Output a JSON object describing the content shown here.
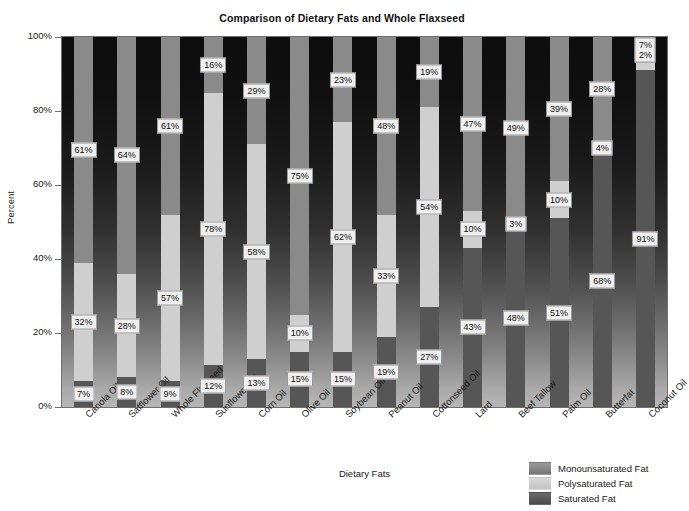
{
  "chart_data": {
    "type": "bar",
    "subtype": "stacked-column-100",
    "title": "Comparison of Dietary Fats and Whole Flaxseed",
    "xlabel": "Dietary Fats",
    "ylabel": "Percent",
    "ylim": [
      0,
      100
    ],
    "yticks": [
      "0%",
      "20%",
      "40%",
      "60%",
      "80%",
      "100%"
    ],
    "ytick_values": [
      0,
      20,
      40,
      60,
      80,
      100
    ],
    "grid": false,
    "legend_position": "bottom-right",
    "value_suffix": "%",
    "categories": [
      "Canola Oil",
      "Safflower Oil",
      "Whole Flaxseed",
      "Sunflower Oil",
      "Corn Oil",
      "Olive Oil",
      "Soybean Oil",
      "Peanut Oil",
      "Cottonseed Oil",
      "Lard",
      "Beef Tallow",
      "Palm Oil",
      "Butterfat",
      "Coconut Oil"
    ],
    "series": [
      {
        "name": "Monounsaturated Fat",
        "color": "#8a8a8a",
        "values": [
          61,
          64,
          61,
          16,
          29,
          75,
          23,
          48,
          19,
          47,
          49,
          39,
          28,
          7
        ]
      },
      {
        "name": "Polysaturated Fat",
        "color": "#cfcfcf",
        "values": [
          32,
          28,
          57,
          78,
          58,
          10,
          62,
          33,
          54,
          10,
          3,
          10,
          4,
          2
        ]
      },
      {
        "name": "Saturated Fat",
        "color": "#565656",
        "values": [
          7,
          8,
          9,
          12,
          13,
          15,
          15,
          19,
          27,
          43,
          48,
          51,
          68,
          91
        ]
      }
    ],
    "data_labels": [
      {
        "category": "Canola Oil",
        "mono": "61%",
        "poly": "32%",
        "sat": "7%"
      },
      {
        "category": "Safflower Oil",
        "mono": "64%",
        "poly": "28%",
        "sat": "8%"
      },
      {
        "category": "Whole Flaxseed",
        "mono": "61%",
        "poly": "57%",
        "sat": "9%"
      },
      {
        "category": "Sunflower Oil",
        "mono": "16%",
        "poly": "78%",
        "sat": "12%"
      },
      {
        "category": "Corn Oil",
        "mono": "29%",
        "poly": "58%",
        "sat": "13%"
      },
      {
        "category": "Olive Oil",
        "mono": "75%",
        "poly": "10%",
        "sat": "15%"
      },
      {
        "category": "Soybean Oil",
        "mono": "23%",
        "poly": "62%",
        "sat": "15%"
      },
      {
        "category": "Peanut Oil",
        "mono": "48%",
        "poly": "33%",
        "sat": "19%"
      },
      {
        "category": "Cottonseed Oil",
        "mono": "19%",
        "poly": "54%",
        "sat": "27%"
      },
      {
        "category": "Lard",
        "mono": "47%",
        "poly": "10%",
        "sat": "43%"
      },
      {
        "category": "Beef Tallow",
        "mono": "49%",
        "poly": "3%",
        "sat": "48%"
      },
      {
        "category": "Palm Oil",
        "mono": "39%",
        "poly": "10%",
        "sat": "51%"
      },
      {
        "category": "Butterfat",
        "mono": "28%",
        "poly": "4%",
        "sat": "68%"
      },
      {
        "category": "Coconut Oil",
        "mono": "7%",
        "poly": "2%",
        "sat": "91%"
      }
    ]
  },
  "legend": {
    "items": [
      {
        "label": "Monounsaturated Fat",
        "swatch": "sw-mono"
      },
      {
        "label": "Polysaturated Fat",
        "swatch": "sw-poly"
      },
      {
        "label": "Saturated Fat",
        "swatch": "sw-sat"
      }
    ]
  },
  "colors": {
    "monounsaturated": "#8a8a8a",
    "polysaturated": "#cfcfcf",
    "saturated": "#565656",
    "plot_background_top": "#0d0d0d",
    "plot_background_bottom": "#b6b6b6",
    "axis": "#6f6f6f",
    "label_background": "#efefef",
    "text": "#1a1a1a"
  }
}
